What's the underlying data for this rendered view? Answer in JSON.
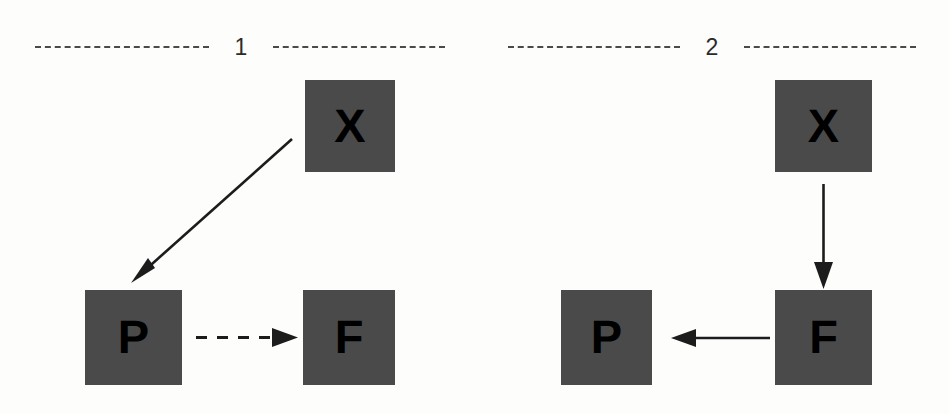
{
  "figure": {
    "background_color": "#fdfdfc",
    "node_fill_color": "#4a4a4a",
    "node_text_color": "#000000",
    "arrow_color": "#1c1c1c",
    "rule_color": "#4a4a4a"
  },
  "panels": [
    {
      "number": "1",
      "nodes": [
        {
          "id": "x",
          "label": "X"
        },
        {
          "id": "p",
          "label": "P"
        },
        {
          "id": "f",
          "label": "F"
        }
      ],
      "edges": [
        {
          "from": "X",
          "to": "P",
          "style": "solid",
          "direction": "diagonal-down-left"
        },
        {
          "from": "P",
          "to": "F",
          "style": "dashed",
          "direction": "right"
        }
      ]
    },
    {
      "number": "2",
      "nodes": [
        {
          "id": "x",
          "label": "X"
        },
        {
          "id": "p",
          "label": "P"
        },
        {
          "id": "f",
          "label": "F"
        }
      ],
      "edges": [
        {
          "from": "X",
          "to": "F",
          "style": "solid",
          "direction": "down"
        },
        {
          "from": "F",
          "to": "P",
          "style": "solid",
          "direction": "left"
        }
      ]
    }
  ]
}
